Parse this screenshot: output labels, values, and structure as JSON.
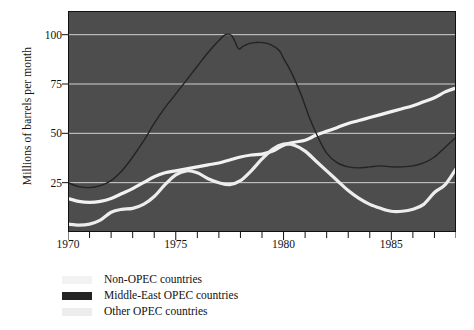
{
  "chart_data": {
    "type": "line",
    "title": "",
    "xlabel": "",
    "ylabel": "Millions of barrels per month",
    "xlim": [
      1970,
      1988
    ],
    "ylim": [
      0,
      112
    ],
    "grid": true,
    "grid_axis": "y",
    "legend_position": "below-left",
    "background_color": "#4d4d4d",
    "xticks_major": [
      1970,
      1975,
      1980,
      1985
    ],
    "xtick_labels": [
      "1970",
      "1975",
      "1980",
      "1985"
    ],
    "xticks_minor_step": 1,
    "yticks": [
      25,
      50,
      75,
      100
    ],
    "ytick_labels": [
      "25",
      "50",
      "75",
      "100"
    ],
    "series": [
      {
        "name": "Non-OPEC countries",
        "color": "#f2f2f2",
        "x": [
          1970,
          1970.5,
          1971,
          1971.5,
          1972,
          1972.5,
          1973,
          1973.5,
          1974,
          1974.5,
          1975,
          1975.5,
          1976,
          1976.5,
          1977,
          1977.5,
          1978,
          1978.5,
          1979,
          1979.5,
          1980,
          1980.5,
          1981,
          1981.5,
          1982,
          1982.5,
          1983,
          1983.5,
          1984,
          1984.5,
          1985,
          1985.5,
          1986,
          1986.5,
          1987,
          1987.5,
          1988
        ],
        "values": [
          17,
          15.5,
          15,
          15.5,
          17,
          19.5,
          22,
          25,
          28,
          30,
          31,
          32,
          33,
          34,
          35,
          36.5,
          38,
          39,
          39.5,
          41,
          44,
          45.5,
          46.5,
          49,
          51,
          53,
          55,
          56.5,
          58,
          59.5,
          61,
          62.5,
          64,
          66,
          68,
          71,
          73
        ]
      },
      {
        "name": "Middle-East OPEC countries",
        "color": "#232323",
        "x": [
          1970,
          1970.5,
          1971,
          1971.5,
          1972,
          1972.5,
          1973,
          1973.5,
          1974,
          1974.5,
          1975,
          1975.5,
          1976,
          1976.5,
          1977,
          1977.3,
          1977.6,
          1977.9,
          1978.1,
          1978.4,
          1978.7,
          1979,
          1979.4,
          1979.8,
          1980,
          1980.4,
          1980.8,
          1981.2,
          1981.6,
          1982,
          1982.5,
          1983,
          1983.5,
          1984,
          1984.5,
          1985,
          1985.5,
          1986,
          1986.5,
          1987,
          1987.5,
          1988
        ],
        "values": [
          25,
          23,
          22.5,
          23.5,
          26,
          31,
          38,
          46,
          55,
          63,
          70,
          77,
          84,
          91,
          97,
          100,
          99.5,
          93,
          94,
          95.5,
          96,
          96,
          95,
          92,
          88,
          80,
          70,
          58,
          48,
          40,
          35,
          33,
          32.5,
          33,
          33.5,
          33,
          33,
          33.5,
          35,
          38,
          43,
          48
        ]
      },
      {
        "name": "Other OPEC countries",
        "color": "#ededed",
        "x": [
          1970,
          1970.5,
          1971,
          1971.5,
          1972,
          1972.5,
          1973,
          1973.5,
          1974,
          1974.5,
          1975,
          1975.5,
          1976,
          1976.5,
          1977,
          1977.5,
          1978,
          1978.5,
          1979,
          1979.5,
          1980,
          1980.5,
          1981,
          1981.5,
          1982,
          1982.5,
          1983,
          1983.5,
          1984,
          1984.5,
          1985,
          1985.5,
          1986,
          1986.5,
          1987,
          1987.5,
          1988
        ],
        "values": [
          4,
          3.5,
          4,
          6,
          10,
          11.5,
          12,
          14,
          18,
          24,
          29,
          31,
          30,
          27,
          25,
          24,
          26,
          31,
          37,
          42,
          44.5,
          44,
          41,
          36,
          31,
          26,
          21,
          17,
          14,
          12,
          10.5,
          10.5,
          11.5,
          14,
          20,
          24,
          32
        ]
      }
    ],
    "annotations": []
  },
  "legend": {
    "items": [
      {
        "label": "Non-OPEC countries",
        "color": "#f2f2f2"
      },
      {
        "label": "Middle-East OPEC countries",
        "color": "#232323"
      },
      {
        "label": "Other OPEC countries",
        "color": "#ededed"
      }
    ]
  }
}
